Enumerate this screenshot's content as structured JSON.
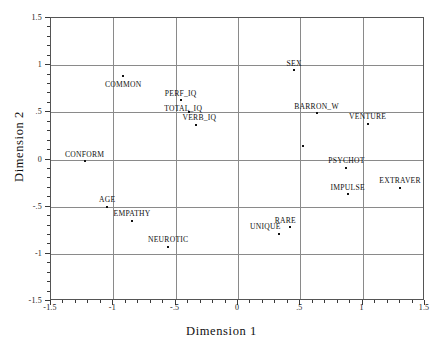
{
  "chart_data": {
    "type": "scatter",
    "title": "",
    "xlabel": "Dimension 1",
    "ylabel": "Dimension 2",
    "xlim": [
      -1.5,
      1.5
    ],
    "ylim": [
      -1.5,
      1.5
    ],
    "grid": true,
    "legend": "none",
    "x_ticks": [
      "-1.5",
      "-1",
      "-.5",
      "0",
      ".5",
      "1",
      "1.5"
    ],
    "x_tick_values": [
      -1.5,
      -1,
      -0.5,
      0,
      0.5,
      1,
      1.5
    ],
    "y_ticks": [
      "1.5",
      "1",
      ".5",
      "0",
      "-.5",
      "-1",
      "-1.5"
    ],
    "y_tick_values": [
      1.5,
      1,
      0.5,
      0,
      -0.5,
      -1,
      -1.5
    ],
    "minor_ticks_per_interval": 5,
    "points": [
      {
        "label": "COMMON",
        "x": -0.92,
        "y": 0.89,
        "label_dx": 0,
        "label_dy": -0.09
      },
      {
        "label": "SEX",
        "x": 0.45,
        "y": 0.95,
        "label_dx": 0,
        "label_dy": 0.07
      },
      {
        "label": "PERF_IQ",
        "x": -0.46,
        "y": 0.63,
        "label_dx": 0,
        "label_dy": 0.07
      },
      {
        "label": "TOTAL_IQ",
        "x": -0.39,
        "y": 0.5,
        "label_dx": -0.05,
        "label_dy": 0.05
      },
      {
        "label": "VERB_IQ",
        "x": -0.34,
        "y": 0.37,
        "label_dx": 0.03,
        "label_dy": 0.08
      },
      {
        "label": "BARRON_W",
        "x": 0.63,
        "y": 0.49,
        "label_dx": 0,
        "label_dy": 0.08
      },
      {
        "label": "VENTURE",
        "x": 1.04,
        "y": 0.38,
        "label_dx": 0,
        "label_dy": 0.08
      },
      {
        "label": "",
        "x": 0.52,
        "y": 0.14,
        "label_dx": 0,
        "label_dy": 0
      },
      {
        "label": "CONFORM",
        "x": -1.23,
        "y": -0.02,
        "label_dx": 0,
        "label_dy": 0.08
      },
      {
        "label": "PSYCHOT",
        "x": 0.87,
        "y": -0.09,
        "label_dx": 0,
        "label_dy": 0.08
      },
      {
        "label": "EXTRAVER",
        "x": 1.3,
        "y": -0.3,
        "label_dx": 0,
        "label_dy": 0.08
      },
      {
        "label": "IMPULSE",
        "x": 0.88,
        "y": -0.37,
        "label_dx": 0,
        "label_dy": 0.08
      },
      {
        "label": "AGE",
        "x": -1.05,
        "y": -0.5,
        "label_dx": 0,
        "label_dy": 0.08
      },
      {
        "label": "EMPATHY",
        "x": -0.85,
        "y": -0.65,
        "label_dx": 0,
        "label_dy": 0.08
      },
      {
        "label": "RARE",
        "x": 0.42,
        "y": -0.72,
        "label_dx": -0.04,
        "label_dy": 0.08
      },
      {
        "label": "UNIQUE",
        "x": 0.33,
        "y": -0.79,
        "label_dx": -0.11,
        "label_dy": 0.08
      },
      {
        "label": "NEUROTIC",
        "x": -0.56,
        "y": -0.93,
        "label_dx": 0,
        "label_dy": 0.09
      }
    ]
  },
  "colors": {
    "point": "#111111",
    "grid": "#8a8a8a",
    "frame": "#555555",
    "text": "#1a1a1a",
    "background": "#ffffff"
  }
}
